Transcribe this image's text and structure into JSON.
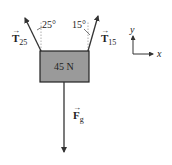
{
  "diagram": {
    "type": "free-body diagram",
    "block": {
      "label": "45 N",
      "fill": "#9a9a9a",
      "stroke": "#222222"
    },
    "forces": [
      {
        "symbol": "T",
        "subscript": "25",
        "angle_label": "25°",
        "direction": "up-left"
      },
      {
        "symbol": "T",
        "subscript": "15",
        "angle_label": "15°",
        "direction": "up-right"
      },
      {
        "symbol": "F",
        "subscript": "g",
        "direction": "down"
      }
    ],
    "axes": {
      "x_label": "x",
      "y_label": "y"
    }
  }
}
